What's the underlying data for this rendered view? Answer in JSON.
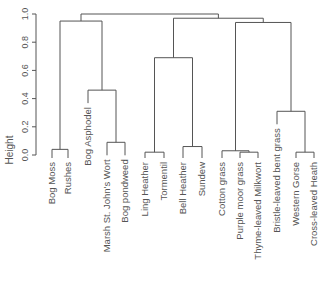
{
  "chart_data": {
    "type": "dendrogram",
    "title": "",
    "xlabel": "",
    "ylabel": "Height",
    "ylim": [
      0,
      1.0
    ],
    "yticks": [
      "0.0",
      "0.2",
      "0.4",
      "0.6",
      "0.8",
      "1.0"
    ],
    "leaves": [
      "Bog Moss",
      "Rushes",
      "Bog Asphodel",
      "Marsh St. John's Wort",
      "Bog pondweed",
      "Ling Heather",
      "Tormentil",
      "Bell Heather",
      "Sundew",
      "Cotton grass",
      "Purple moor grass",
      "Thyme-leaved Milkwort",
      "Bristle-leaved bent grass",
      "Western Gorse",
      "Cross-leaved Heath"
    ],
    "merges": [
      {
        "id": "m1",
        "left": "Bog Moss",
        "right": "Rushes",
        "height": 0.04
      },
      {
        "id": "m2",
        "left": "Marsh St. John's Wort",
        "right": "Bog pondweed",
        "height": 0.09
      },
      {
        "id": "m3",
        "left": "Bog Asphodel",
        "right": "m2",
        "height": 0.46
      },
      {
        "id": "m4",
        "left": "m1",
        "right": "m3",
        "height": 0.95
      },
      {
        "id": "m5",
        "left": "Ling Heather",
        "right": "Tormentil",
        "height": 0.02
      },
      {
        "id": "m6",
        "left": "Bell Heather",
        "right": "Sundew",
        "height": 0.06
      },
      {
        "id": "m7",
        "left": "m5",
        "right": "m6",
        "height": 0.69
      },
      {
        "id": "m8",
        "left": "Purple moor grass",
        "right": "Thyme-leaved Milkwort",
        "height": 0.02
      },
      {
        "id": "m9",
        "left": "Cotton grass",
        "right": "m8",
        "height": 0.03
      },
      {
        "id": "m10",
        "left": "Western Gorse",
        "right": "Cross-leaved Heath",
        "height": 0.02
      },
      {
        "id": "m11",
        "left": "Bristle-leaved bent grass",
        "right": "m10",
        "height": 0.31
      },
      {
        "id": "m12",
        "left": "m9",
        "right": "m11",
        "height": 0.94
      },
      {
        "id": "m13",
        "left": "m7",
        "right": "m12",
        "height": 0.97
      },
      {
        "id": "m14",
        "left": "m4",
        "right": "m13",
        "height": 1.0
      }
    ],
    "colors": {
      "lines": "#555555",
      "text": "#555555"
    }
  }
}
